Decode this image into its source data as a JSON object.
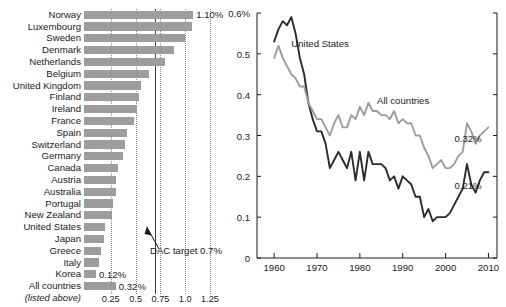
{
  "chart_data": [
    {
      "id": "aid-by-country",
      "type": "bar",
      "orientation": "horizontal",
      "title": "",
      "xlabel": "",
      "ylabel": "",
      "xlim": [
        0,
        1.3
      ],
      "xticks": [
        0.25,
        0.5,
        0.75,
        1.0,
        1.25
      ],
      "xtick_labels": [
        "0.25",
        "0.5",
        "0.75",
        "1.0",
        "1.25"
      ],
      "grid": "vertical-dotted",
      "categories": [
        "Norway",
        "Luxembourg",
        "Sweden",
        "Denmark",
        "Netherlands",
        "Belgium",
        "United Kingdom",
        "Finland",
        "Ireland",
        "France",
        "Spain",
        "Switzerland",
        "Germany",
        "Canada",
        "Austria",
        "Australia",
        "Portugal",
        "New Zealand",
        "United States",
        "Japan",
        "Greece",
        "Italy",
        "Korea",
        "All countries"
      ],
      "values": [
        1.1,
        1.09,
        1.02,
        0.91,
        0.82,
        0.65,
        0.57,
        0.55,
        0.53,
        0.5,
        0.43,
        0.41,
        0.39,
        0.34,
        0.32,
        0.32,
        0.29,
        0.28,
        0.21,
        0.2,
        0.17,
        0.15,
        0.12,
        0.32
      ],
      "data_labels": {
        "Norway": "1.10%",
        "Korea": "0.12%",
        "All countries": "0.32%"
      },
      "annotations": [
        {
          "text": "DAC target 0.7%",
          "x": 0.7,
          "type": "reference-line-with-arrow"
        }
      ],
      "footnote": "(listed above)",
      "bar_color": "#9d9d9d",
      "reference_line_color": "#3a3a3a",
      "gridline_color": "#8b8b8b"
    },
    {
      "id": "aid-over-time",
      "type": "line",
      "title": "",
      "xlabel": "",
      "ylabel": "",
      "xlim": [
        1956,
        2012
      ],
      "ylim": [
        0,
        0.6
      ],
      "xticks": [
        1960,
        1970,
        1980,
        1990,
        2000,
        2010
      ],
      "xtick_labels": [
        "1960",
        "1970",
        "1980",
        "1990",
        "2000",
        "2010"
      ],
      "yticks": [
        0,
        0.1,
        0.2,
        0.3,
        0.4,
        0.5,
        0.6
      ],
      "ytick_labels": [
        "0",
        "0.1",
        "0.2",
        "0.3",
        "0.4",
        "0.5",
        "0.6%"
      ],
      "grid": false,
      "legend_position": "inline-annotations",
      "series": [
        {
          "name": "United States",
          "color": "#2b2b2b",
          "label_x": 1964,
          "label_y": 0.525,
          "end_label": "0.21%",
          "x": [
            1960,
            1961,
            1962,
            1963,
            1964,
            1965,
            1966,
            1967,
            1968,
            1969,
            1970,
            1971,
            1972,
            1973,
            1974,
            1975,
            1976,
            1977,
            1978,
            1979,
            1980,
            1981,
            1982,
            1983,
            1984,
            1985,
            1986,
            1987,
            1988,
            1989,
            1990,
            1991,
            1992,
            1993,
            1994,
            1995,
            1996,
            1997,
            1998,
            1999,
            2000,
            2001,
            2002,
            2003,
            2004,
            2005,
            2006,
            2007,
            2008,
            2009,
            2010
          ],
          "values": [
            0.53,
            0.56,
            0.58,
            0.57,
            0.59,
            0.55,
            0.49,
            0.45,
            0.38,
            0.34,
            0.31,
            0.31,
            0.28,
            0.22,
            0.24,
            0.26,
            0.24,
            0.22,
            0.26,
            0.19,
            0.26,
            0.19,
            0.26,
            0.23,
            0.23,
            0.23,
            0.22,
            0.19,
            0.2,
            0.17,
            0.2,
            0.19,
            0.18,
            0.15,
            0.15,
            0.1,
            0.12,
            0.09,
            0.1,
            0.1,
            0.1,
            0.11,
            0.13,
            0.15,
            0.17,
            0.23,
            0.18,
            0.16,
            0.19,
            0.21,
            0.21
          ]
        },
        {
          "name": "All countries",
          "color": "#9d9d9d",
          "label_x": 1984,
          "label_y": 0.385,
          "end_label": "0.32%",
          "x": [
            1960,
            1961,
            1962,
            1963,
            1964,
            1965,
            1966,
            1967,
            1968,
            1969,
            1970,
            1971,
            1972,
            1973,
            1974,
            1975,
            1976,
            1977,
            1978,
            1979,
            1980,
            1981,
            1982,
            1983,
            1984,
            1985,
            1986,
            1987,
            1988,
            1989,
            1990,
            1991,
            1992,
            1993,
            1994,
            1995,
            1996,
            1997,
            1998,
            1999,
            2000,
            2001,
            2002,
            2003,
            2004,
            2005,
            2006,
            2007,
            2008,
            2009,
            2010
          ],
          "values": [
            0.49,
            0.52,
            0.49,
            0.47,
            0.45,
            0.44,
            0.42,
            0.42,
            0.38,
            0.36,
            0.34,
            0.34,
            0.32,
            0.3,
            0.33,
            0.35,
            0.32,
            0.32,
            0.35,
            0.34,
            0.37,
            0.35,
            0.38,
            0.36,
            0.36,
            0.35,
            0.35,
            0.34,
            0.36,
            0.33,
            0.34,
            0.33,
            0.33,
            0.3,
            0.3,
            0.27,
            0.25,
            0.22,
            0.23,
            0.24,
            0.22,
            0.22,
            0.23,
            0.25,
            0.26,
            0.33,
            0.31,
            0.28,
            0.3,
            0.31,
            0.32
          ]
        }
      ]
    }
  ],
  "bar_chart": {
    "rows": [
      {
        "label": "Norway",
        "value": 1.1,
        "data_label": "1.10%"
      },
      {
        "label": "Luxembourg",
        "value": 1.09,
        "data_label": ""
      },
      {
        "label": "Sweden",
        "value": 1.02,
        "data_label": ""
      },
      {
        "label": "Denmark",
        "value": 0.91,
        "data_label": ""
      },
      {
        "label": "Netherlands",
        "value": 0.82,
        "data_label": ""
      },
      {
        "label": "Belgium",
        "value": 0.65,
        "data_label": ""
      },
      {
        "label": "United Kingdom",
        "value": 0.57,
        "data_label": ""
      },
      {
        "label": "Finland",
        "value": 0.55,
        "data_label": ""
      },
      {
        "label": "Ireland",
        "value": 0.53,
        "data_label": ""
      },
      {
        "label": "France",
        "value": 0.5,
        "data_label": ""
      },
      {
        "label": "Spain",
        "value": 0.43,
        "data_label": ""
      },
      {
        "label": "Switzerland",
        "value": 0.41,
        "data_label": ""
      },
      {
        "label": "Germany",
        "value": 0.39,
        "data_label": ""
      },
      {
        "label": "Canada",
        "value": 0.34,
        "data_label": ""
      },
      {
        "label": "Austria",
        "value": 0.32,
        "data_label": ""
      },
      {
        "label": "Australia",
        "value": 0.32,
        "data_label": ""
      },
      {
        "label": "Portugal",
        "value": 0.29,
        "data_label": ""
      },
      {
        "label": "New Zealand",
        "value": 0.28,
        "data_label": ""
      },
      {
        "label": "United States",
        "value": 0.21,
        "data_label": ""
      },
      {
        "label": "Japan",
        "value": 0.2,
        "data_label": ""
      },
      {
        "label": "Greece",
        "value": 0.17,
        "data_label": ""
      },
      {
        "label": "Italy",
        "value": 0.15,
        "data_label": ""
      },
      {
        "label": "Korea",
        "value": 0.12,
        "data_label": "0.12%"
      },
      {
        "label": "All countries",
        "value": 0.32,
        "data_label": "0.32%"
      }
    ],
    "footnote": "(listed above)",
    "xticks": [
      "0.25",
      "0.5",
      "0.75",
      "1.0",
      "1.25"
    ],
    "dac_annotation": "DAC target 0.7%"
  },
  "line_chart": {
    "ytick_labels": [
      "0.6%",
      "0.5",
      "0.4",
      "0.3",
      "0.2",
      "0.1",
      "0"
    ],
    "xtick_labels": [
      "1960",
      "1970",
      "1980",
      "1990",
      "2000",
      "2010"
    ],
    "series_labels": [
      "United States",
      "All countries"
    ],
    "end_labels": [
      "0.32%",
      "0.21%"
    ]
  },
  "colors": {
    "bar": "#9d9d9d",
    "us_line": "#2b2b2b",
    "all_line": "#9d9d9d",
    "gridline": "#8b8b8b",
    "reference_line": "#3a3a3a",
    "text": "#1a1a1a",
    "background": "#ffffff"
  }
}
